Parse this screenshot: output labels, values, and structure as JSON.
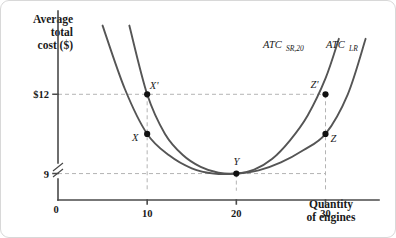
{
  "chart_data": {
    "type": "line",
    "title": "",
    "xlabel": "Quantity of engines",
    "ylabel": "Average total cost ($)",
    "ylabel_lines": [
      "Average",
      "total",
      "cost ($)"
    ],
    "xlabel_lines": [
      "Quantity",
      "of engines"
    ],
    "origin_label": "0",
    "xlim": [
      0,
      36
    ],
    "ylim": [
      8,
      15
    ],
    "y_axis_broken": true,
    "grid": false,
    "gridlines_dashed": true,
    "legend_position": "inline-curve-labels",
    "xticks": [
      10,
      20,
      30
    ],
    "xtick_labels": [
      "10",
      "20",
      "30"
    ],
    "yticks": [
      9,
      12
    ],
    "ytick_labels": [
      "9",
      "$12"
    ],
    "series": [
      {
        "name": "ATC_SR,20",
        "label_main": "ATC",
        "label_sub": "SR,20",
        "color": "#555555",
        "description": "Short-run average total cost curve for plant size 20",
        "x": [
          8,
          10,
          12,
          14,
          16,
          18,
          20,
          22,
          24,
          26,
          28,
          30,
          31.5
        ],
        "y": [
          14.6,
          12.0,
          10.5,
          9.7,
          9.25,
          9.03,
          9.0,
          9.15,
          9.55,
          10.25,
          11.2,
          12.6,
          14.1
        ]
      },
      {
        "name": "ATC_LR",
        "label_main": "ATC",
        "label_sub": "LR",
        "color": "#555555",
        "description": "Long-run average total cost curve (envelope)",
        "x": [
          5,
          7.5,
          10,
          12.5,
          15,
          17.5,
          20,
          22.5,
          25,
          27.5,
          30,
          32.5,
          34.5
        ],
        "y": [
          14.6,
          12.2,
          10.5,
          9.68,
          9.2,
          9.0,
          9.0,
          9.12,
          9.42,
          9.88,
          10.5,
          12.0,
          14.1
        ]
      }
    ],
    "points": [
      {
        "id": "X-prime",
        "label": "X'",
        "x": 10,
        "y": 12.0,
        "on_series": "ATC_SR,20",
        "label_dx": 7,
        "label_dy": -5
      },
      {
        "id": "X",
        "label": "X",
        "x": 10,
        "y": 10.5,
        "on_series": "ATC_LR",
        "label_dx": -12,
        "label_dy": 7
      },
      {
        "id": "Y",
        "label": "Y",
        "x": 20,
        "y": 9.0,
        "on_series": "both",
        "label_dx": 0,
        "label_dy": -9
      },
      {
        "id": "Z-prime",
        "label": "Z'",
        "x": 30,
        "y": 12.0,
        "on_series": "ATC_SR,20",
        "label_dx": -11,
        "label_dy": -6
      },
      {
        "id": "Z",
        "label": "Z",
        "x": 30,
        "y": 10.5,
        "on_series": "ATC_LR",
        "label_dx": 8,
        "label_dy": 8
      }
    ],
    "annotations": [
      {
        "type": "dashed-horizontal",
        "value": 12,
        "from_x": 0,
        "to_x": 30
      },
      {
        "type": "dashed-horizontal",
        "value": 9,
        "from_x": 0,
        "to_x": 30
      },
      {
        "type": "dashed-vertical",
        "value": 10,
        "from_y": 8.35,
        "to_y": 12
      },
      {
        "type": "dashed-vertical",
        "value": 20,
        "from_y": 8.35,
        "to_y": 9
      },
      {
        "type": "dashed-vertical",
        "value": 30,
        "from_y": 8.35,
        "to_y": 12
      }
    ]
  }
}
